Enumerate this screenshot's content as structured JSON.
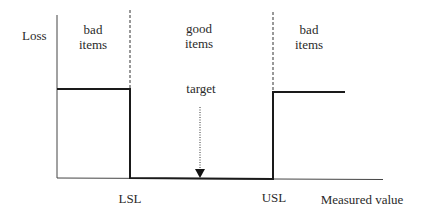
{
  "diagram": {
    "y_axis_label": "Loss",
    "x_axis_label": "Measured value",
    "regions": [
      {
        "line1": "bad",
        "line2": "items"
      },
      {
        "line1": "good",
        "line2": "items"
      },
      {
        "line1": "bad",
        "line2": "items"
      }
    ],
    "target_label": "target",
    "lsl_label": "LSL",
    "usl_label": "USL",
    "colors": {
      "line": "#1a1a1a",
      "axis": "#333333",
      "text": "#2a2a2a",
      "background": "#ffffff"
    }
  }
}
